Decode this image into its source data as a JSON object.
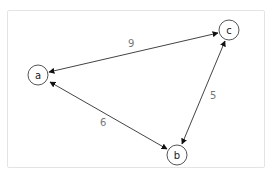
{
  "diagram": {
    "type": "weighted-bidirectional-graph",
    "nodes": [
      {
        "id": "a",
        "label": "a"
      },
      {
        "id": "b",
        "label": "b"
      },
      {
        "id": "c",
        "label": "c"
      }
    ],
    "edges": [
      {
        "from": "a",
        "to": "c",
        "weight": "9",
        "directed": "both"
      },
      {
        "from": "c",
        "to": "b",
        "weight": "5",
        "directed": "both"
      },
      {
        "from": "a",
        "to": "b",
        "weight": "6",
        "directed": "both"
      }
    ],
    "colors": {
      "frame_border": "#e4e4e4",
      "edge": "#444444",
      "node_stroke": "#555555",
      "edge_label": "#777777",
      "node_label": "#222222"
    }
  }
}
